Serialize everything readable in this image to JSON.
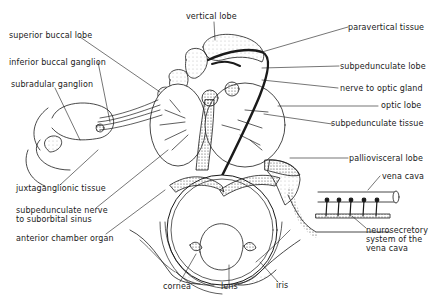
{
  "diagram": {
    "labels": {
      "vertical_lobe": "vertical lobe",
      "superior_buccal_lobe": "superior buccal lobe",
      "inferior_buccal_ganglion": "inferior buccal ganglion",
      "subradular_ganglion": "subradular ganglion",
      "paravertical_tissue": "paravertical tissue",
      "subpedunculate_lobe": "subpedunculate lobe",
      "nerve_to_optic_gland": "nerve to optic gland",
      "optic_lobe": "optic lobe",
      "subpedunculate_tissue": "subpedunculate tissue",
      "palliovisceral_lobe": "palliovisceral lobe",
      "vena_cava": "vena cava",
      "juxtaganglionic_tissue": "juxtaganglionic tissue",
      "subpedunculate_nerve": "subpedunculate nerve\nto suborbital sinus",
      "anterior_chamber_organ": "anterior chamber organ",
      "neurosecretory_system": "neurosecretory\nsystem of the\nvena cava",
      "cornea": "cornea",
      "lens": "lens",
      "iris": "iris"
    },
    "colors": {
      "ink": "#1a1a1a",
      "stipple": "#555555",
      "background": "#ffffff"
    }
  }
}
